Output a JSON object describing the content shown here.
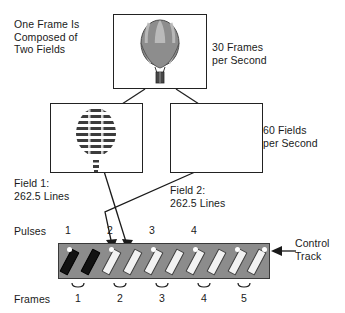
{
  "diagram": {
    "title_hidden": "",
    "labels": {
      "one_frame": "One Frame Is\nComposed of\nTwo Fields",
      "thirty_frames": "30 Frames\nper Second",
      "sixty_fields": "60 Fields\nper Second",
      "field1": "Field 1:\n262.5 Lines",
      "field2": "Field 2:\n262.5 Lines",
      "pulses": "Pulses",
      "frames": "Frames",
      "control_track": "Control\nTrack"
    },
    "pulse_numbers": [
      "1",
      "2",
      "3",
      "4"
    ],
    "frame_numbers": [
      "1",
      "2",
      "3",
      "4",
      "5"
    ],
    "colors": {
      "tape_fill": "#8c8c8c",
      "tape_border": "#3a3a3a",
      "bar_white": "#f2f2f2",
      "bar_black": "#121212",
      "pulse_dot": "#ffffff",
      "line": "#222222",
      "text": "#1a1a1a",
      "balloon_body": "#8d8d8d",
      "balloon_gore": "#b8b8b8",
      "balloon_outline": "#4a4a4a",
      "basket": "#444444"
    },
    "icons": {
      "frame_balloon": "hot-air-balloon-full-frame",
      "field1_balloon": "hot-air-balloon-interlaced-field",
      "field2_balloon": "hot-air-balloon-interlaced-field",
      "control_track_arrow": "left-arrow-icon",
      "field1_arrow": "down-arrow-icon",
      "field2_arrow": "down-arrow-icon"
    },
    "counts": {
      "tape_bars_total": 10,
      "tape_bars_black": 2,
      "tape_bars_white": 8,
      "pulse_dots": 6
    }
  }
}
